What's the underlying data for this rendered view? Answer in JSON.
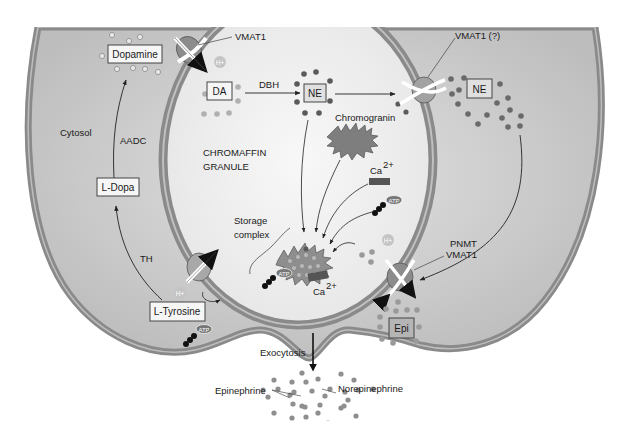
{
  "diagram": {
    "regions": {
      "cytosol": "Cytosol",
      "granule_line1": "CHROMAFFIN",
      "granule_line2": "GRANULE"
    },
    "molecules": {
      "dopamine": "Dopamine",
      "l_dopa": "L-Dopa",
      "l_tyrosine": "L-Tyrosine",
      "da": "DA",
      "ne_granule": "NE",
      "ne_cytosol": "NE",
      "epi": "Epi",
      "chromogranin": "Chromogranin",
      "ca_top": "Ca",
      "ca_top_sup": "2+",
      "ca_bottom": "Ca",
      "ca_bottom_sup": "2+",
      "atp": "ATP",
      "h_plus": "H+"
    },
    "enzymes": {
      "aadc": "AADC",
      "th": "TH",
      "dbh": "DBH",
      "pnmt": "PNMT"
    },
    "transporters": {
      "vmat1_top": "VMAT1",
      "vmat1_right_top": "VMAT1 (?)",
      "vmat1_right_bottom": "VMAT1"
    },
    "labels": {
      "storage_line1": "Storage",
      "storage_line2": "complex",
      "exocytosis": "Exocytosis",
      "epinephrine": "Epinephrine",
      "norepinephrine": "Norepinephrine"
    },
    "colors": {
      "cytosol_fill": "#c8c8c8",
      "membrane": "#8a8a8a",
      "membrane_inner": "#b8b8b8",
      "granule_fill": "#f2f2f2",
      "transporter": "#8c8c8c",
      "dot_light": "#a8a8a8",
      "dot_dark": "#5a5a5a",
      "ca_bar": "#555555",
      "box_fill": "#f6f6f6",
      "epi_box_fill": "#b5b5b5"
    }
  }
}
